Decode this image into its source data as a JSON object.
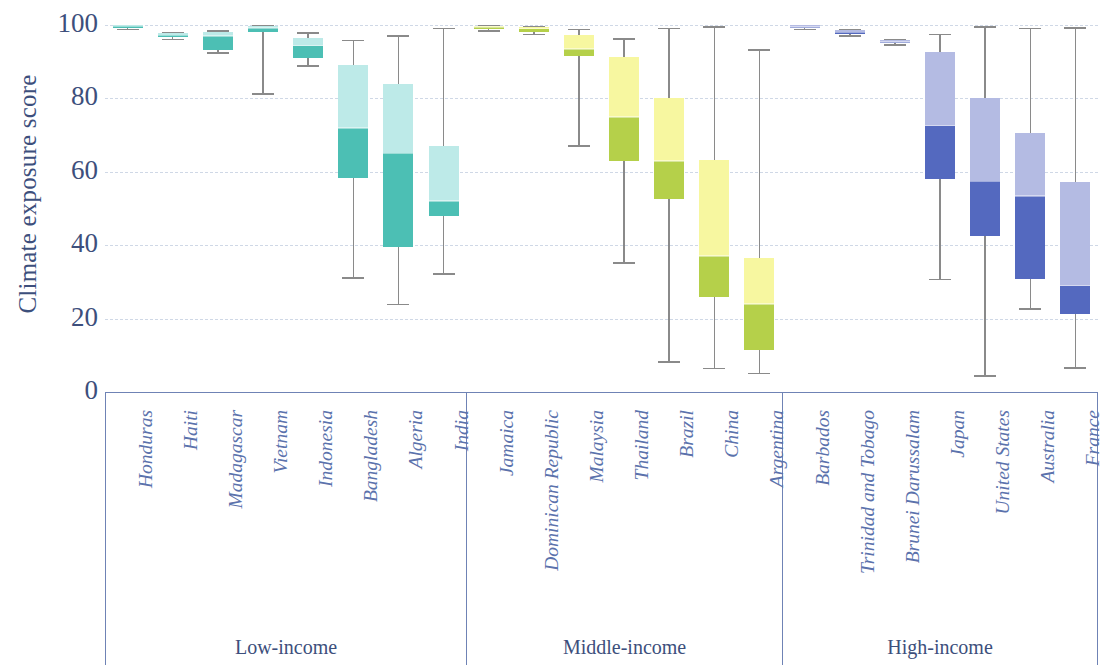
{
  "axis": {
    "y_title": "Climate exposure score",
    "y_ticks": [
      "100",
      "80",
      "60",
      "40",
      "20",
      "0"
    ],
    "y_min": 0,
    "y_max": 100
  },
  "groups": [
    {
      "title": "Low-income",
      "color_dark": "#4cbfb4",
      "color_light": "#bdeae8"
    },
    {
      "title": "Middle-income",
      "color_dark": "#b5d04a",
      "color_light": "#f7f7a0"
    },
    {
      "title": "High-income",
      "color_dark": "#5469bf",
      "color_light": "#b4bbe3"
    }
  ],
  "chart_data": {
    "type": "box",
    "title": "",
    "xlabel": "",
    "ylabel": "Climate exposure score",
    "ylim": [
      0,
      100
    ],
    "yticks": [
      0,
      20,
      40,
      60,
      80,
      100
    ],
    "grid": true,
    "legend": "none",
    "groups": [
      "Low-income",
      "Middle-income",
      "High-income"
    ],
    "group_colors": {
      "Low-income": {
        "dark": "#4cbfb4",
        "light": "#bdeae8"
      },
      "Middle-income": {
        "dark": "#b5d04a",
        "light": "#f7f7a0"
      },
      "High-income": {
        "dark": "#5469bf",
        "light": "#b4bbe3"
      }
    },
    "categories": [
      "Honduras",
      "Haiti",
      "Madagascar",
      "Vietnam",
      "Indonesia",
      "Bangladesh",
      "Algeria",
      "India",
      "Jamaica",
      "Dominican Republic",
      "Malaysia",
      "Thailand",
      "Brazil",
      "China",
      "Argentina",
      "Barbados",
      "Trinidad and Tobago",
      "Brunei Darussalam",
      "Japan",
      "United States",
      "Australia",
      "France"
    ],
    "boxes": [
      {
        "name": "Honduras",
        "group": "Low-income",
        "min": 99.0,
        "q1": 99.2,
        "median": 99.6,
        "q3": 100.0,
        "max": 100.0
      },
      {
        "name": "Haiti",
        "group": "Low-income",
        "min": 96.3,
        "q1": 96.6,
        "median": 97.2,
        "q3": 97.8,
        "max": 98.2
      },
      {
        "name": "Madagascar",
        "group": "Low-income",
        "min": 92.6,
        "q1": 93.2,
        "median": 97.0,
        "q3": 98.2,
        "max": 98.6
      },
      {
        "name": "Vietnam",
        "group": "Low-income",
        "min": 81.4,
        "q1": 98.0,
        "median": 99.2,
        "q3": 99.6,
        "max": 100.0
      },
      {
        "name": "Indonesia",
        "group": "Low-income",
        "min": 89.0,
        "q1": 91.0,
        "median": 94.4,
        "q3": 96.4,
        "max": 98.0
      },
      {
        "name": "Bangladesh",
        "group": "Low-income",
        "min": 31.2,
        "q1": 58.2,
        "median": 72.0,
        "q3": 89.0,
        "max": 96.0
      },
      {
        "name": "Algeria",
        "group": "Low-income",
        "min": 24.0,
        "q1": 39.6,
        "median": 65.0,
        "q3": 84.0,
        "max": 97.2
      },
      {
        "name": "India",
        "group": "Low-income",
        "min": 32.4,
        "q1": 48.0,
        "median": 52.0,
        "q3": 67.0,
        "max": 99.2
      },
      {
        "name": "Jamaica",
        "group": "Middle-income",
        "min": 98.6,
        "q1": 99.0,
        "median": 99.4,
        "q3": 99.8,
        "max": 100.0
      },
      {
        "name": "Dominican Republic",
        "group": "Middle-income",
        "min": 97.6,
        "q1": 98.2,
        "median": 99.0,
        "q3": 99.4,
        "max": 99.8
      },
      {
        "name": "Malaysia",
        "group": "Middle-income",
        "min": 67.2,
        "q1": 91.6,
        "median": 93.4,
        "q3": 97.4,
        "max": 99.0
      },
      {
        "name": "Thailand",
        "group": "Middle-income",
        "min": 35.4,
        "q1": 63.0,
        "median": 75.0,
        "q3": 91.2,
        "max": 96.4
      },
      {
        "name": "Brazil",
        "group": "Middle-income",
        "min": 8.4,
        "q1": 52.6,
        "median": 63.0,
        "q3": 80.0,
        "max": 99.2
      },
      {
        "name": "China",
        "group": "Middle-income",
        "min": 6.6,
        "q1": 26.0,
        "median": 37.0,
        "q3": 63.2,
        "max": 99.6
      },
      {
        "name": "Argentina",
        "group": "Middle-income",
        "min": 5.2,
        "q1": 11.4,
        "median": 24.0,
        "q3": 36.4,
        "max": 93.4
      },
      {
        "name": "Barbados",
        "group": "High-income",
        "min": 99.0,
        "q1": 99.2,
        "median": 99.5,
        "q3": 99.9,
        "max": 100.0
      },
      {
        "name": "Trinidad and Tobago",
        "group": "High-income",
        "min": 97.2,
        "q1": 97.6,
        "median": 98.0,
        "q3": 98.6,
        "max": 99.0
      },
      {
        "name": "Brunei Darussalam",
        "group": "High-income",
        "min": 94.8,
        "q1": 95.0,
        "median": 95.4,
        "q3": 95.8,
        "max": 96.2
      },
      {
        "name": "Japan",
        "group": "High-income",
        "min": 30.8,
        "q1": 58.0,
        "median": 72.6,
        "q3": 92.6,
        "max": 97.6
      },
      {
        "name": "United States",
        "group": "High-income",
        "min": 4.6,
        "q1": 42.4,
        "median": 57.4,
        "q3": 80.2,
        "max": 99.6
      },
      {
        "name": "Australia",
        "group": "High-income",
        "min": 22.8,
        "q1": 30.8,
        "median": 53.4,
        "q3": 70.6,
        "max": 99.2
      },
      {
        "name": "France",
        "group": "High-income",
        "min": 6.8,
        "q1": 21.2,
        "median": 29.0,
        "q3": 57.2,
        "max": 99.4
      }
    ]
  }
}
